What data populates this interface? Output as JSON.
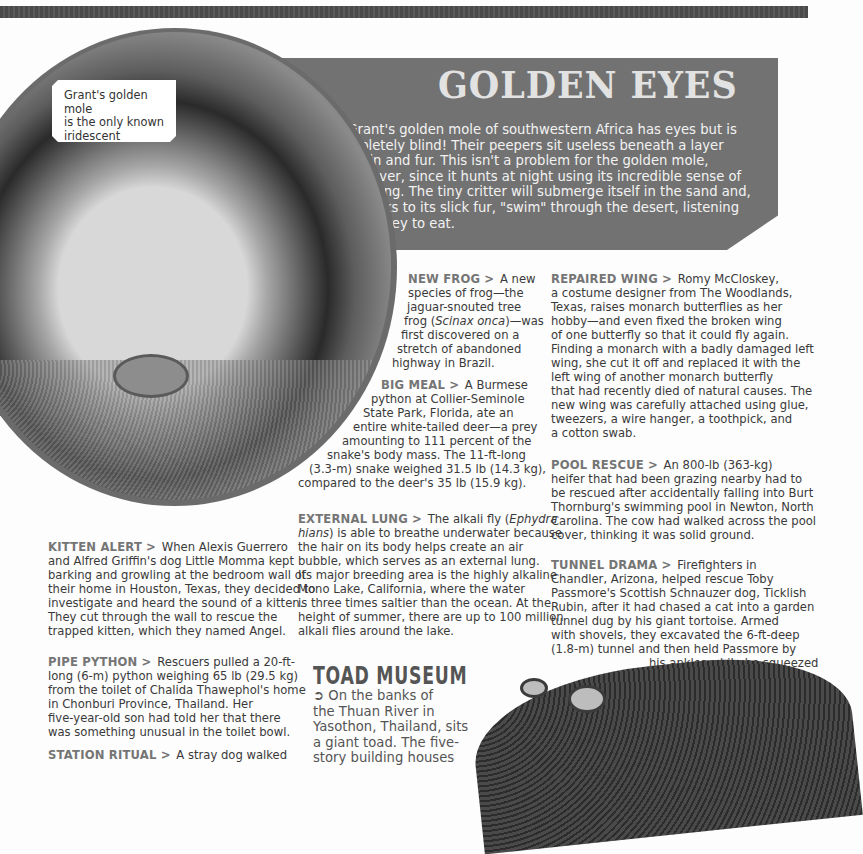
{
  "page": {
    "top_strip": "decorative-band",
    "callout": {
      "lines": [
        "Grant's golden mole",
        "is the only known",
        "iridescent mammal!"
      ]
    },
    "feature": {
      "title": "GOLDEN EYES",
      "bullet_icon": "➲",
      "lines": [
        "Grant's golden mole of southwestern Africa has eyes but is",
        "completely blind! Their peepers sit useless beneath a layer",
        "of skin and fur. This isn't a problem for the golden mole,",
        "however, since it hunts at night using its incredible sense of",
        "hearing. The tiny critter will submerge itself in the sand and,",
        "thanks to its slick fur, \"swim\" through the desert, listening",
        "for prey to eat."
      ]
    },
    "arrow_glyph": ">",
    "items": {
      "new_frog": {
        "heading": "NEW FROG",
        "lines": [
          "A new",
          "species of frog—the",
          "jaguar-snouted tree",
          "frog (",
          "Scinax onca",
          ")—was",
          "first discovered on a",
          "stretch of abandoned",
          "highway in Brazil."
        ]
      },
      "big_meal": {
        "heading": "BIG MEAL",
        "lines": [
          "A Burmese",
          "python at Collier-Seminole",
          "State Park, Florida, ate an",
          "entire white-tailed deer—a prey",
          "amounting to 111 percent of the",
          "snake's body mass. The 11-ft-long",
          "(3.3-m) snake weighed 31.5 lb (14.3 kg),",
          "compared to the deer's 35 lb (15.9 kg)."
        ]
      },
      "external_lung": {
        "heading": "EXTERNAL LUNG",
        "lines": [
          "The alkali fly (",
          "Ephydra",
          "hians",
          ") is able to breathe underwater because",
          "the hair on its body helps create an air",
          "bubble, which serves as an external lung.",
          "Its major breeding area is the highly alkaline",
          "Mono Lake, California, where the water",
          "is three times saltier than the ocean. At the",
          "height of summer, there are up to 100 million",
          "alkali flies around the lake."
        ]
      },
      "repaired_wing": {
        "heading": "REPAIRED WING",
        "lines": [
          "Romy McCloskey,",
          "a costume designer from The Woodlands,",
          "Texas, raises monarch butterflies as her",
          "hobby—and even fixed the broken wing",
          "of one butterfly so that it could fly again.",
          "Finding a monarch with a badly damaged left",
          "wing, she cut it off and replaced it with the",
          "left wing of another monarch butterfly",
          "that had recently died of natural causes. The",
          "new wing was carefully attached using glue,",
          "tweezers, a wire hanger, a toothpick, and",
          "a cotton swab."
        ]
      },
      "pool_rescue": {
        "heading": "POOL RESCUE",
        "lines": [
          "An 800-lb (363-kg)",
          "heifer that had been grazing nearby had to",
          "be rescued after accidentally falling into Burt",
          "Thornburg's swimming pool in Newton, North",
          "Carolina. The cow had walked across the pool",
          "cover, thinking it was solid ground."
        ]
      },
      "tunnel_drama": {
        "heading": "TUNNEL DRAMA",
        "lines": [
          "Firefighters in",
          "Chandler, Arizona, helped rescue Toby",
          "Passmore's Scottish Schnauzer dog, Ticklish",
          "Rubin, after it had chased a cat into a garden",
          "tunnel dug by his giant tortoise. Armed",
          "with shovels, they excavated the 6-ft-deep",
          "(1.8-m) tunnel and then held Passmore by",
          "his ankles while he squeezed",
          "in headfirst and",
          "pulled the dog out."
        ]
      },
      "kitten_alert": {
        "heading": "KITTEN ALERT",
        "lines": [
          "When Alexis Guerrero",
          "and Alfred Griffin's dog Little Momma kept",
          "barking and growling at the bedroom wall of",
          "their home in Houston, Texas, they decided to",
          "investigate and heard the sound of a kitten.",
          "They cut through the wall to rescue the",
          "trapped kitten, which they named Angel."
        ]
      },
      "pipe_python": {
        "heading": "PIPE PYTHON",
        "lines": [
          "Rescuers pulled a 20-ft-",
          "long (6-m) python weighing 65 lb (29.5 kg)",
          "from the toilet of Chalida Thawephol's home",
          "in Chonburi Province, Thailand. Her",
          "five-year-old son had told her that there",
          "was something unusual in the toilet bowl."
        ]
      },
      "station_ritual": {
        "heading": "STATION RITUAL",
        "lines": [
          "A stray dog walked"
        ]
      }
    },
    "toad_museum": {
      "title": "TOAD MUSEUM",
      "bullet_icon": "➲",
      "lines": [
        "On the banks of",
        "the Thuan River in",
        "Yasothon, Thailand, sits",
        "a giant toad. The five-",
        "story building houses"
      ]
    },
    "colors": {
      "banner": "#727272",
      "banner_text": "#f2f2f2",
      "heading_gray": "#757575",
      "body_text": "#3a3a3a"
    }
  }
}
